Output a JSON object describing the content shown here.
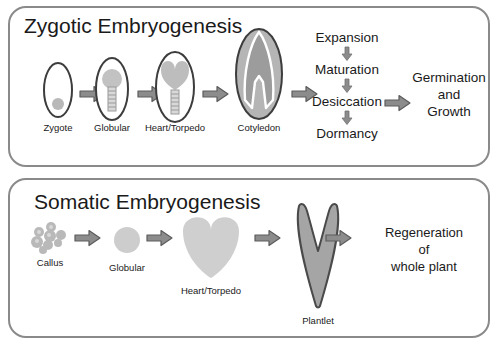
{
  "diagram": {
    "title_semantic": "zygotic-vs-somatic-embryogenesis",
    "colors": {
      "panel_border": "#8a8a8a",
      "arrow_fill": "#8c8c8c",
      "arrow_stroke": "#5c5c5c",
      "embryo_light_gray": "#c9c9c9",
      "embryo_mid_gray": "#a8a8a8",
      "outline_dark": "#3d3d3d",
      "text": "#1a1a1a",
      "background": "#ffffff"
    }
  },
  "panels": [
    {
      "id": "zygotic",
      "title": "Zygotic Embryogenesis",
      "stages": [
        {
          "label": "Zygote",
          "icon": "zygote-embryo-icon"
        },
        {
          "label": "Globular",
          "icon": "globular-embryo-icon"
        },
        {
          "label": "Heart/Torpedo",
          "icon": "heart-torpedo-embryo-icon"
        },
        {
          "label": "Cotyledon",
          "icon": "cotyledon-embryo-icon"
        }
      ],
      "chain": [
        {
          "label": "Expansion"
        },
        {
          "label": "Maturation"
        },
        {
          "label": "Desiccation"
        },
        {
          "label": "Dormancy"
        }
      ],
      "outcome_lines": [
        "Germination",
        "and",
        "Growth"
      ]
    },
    {
      "id": "somatic",
      "title": "Somatic Embryogenesis",
      "stages": [
        {
          "label": "Callus",
          "icon": "callus-cluster-icon"
        },
        {
          "label": "Globular",
          "icon": "globular-embryo-icon"
        },
        {
          "label": "Heart/Torpedo",
          "icon": "heart-torpedo-embryo-icon"
        },
        {
          "label": "Plantlet",
          "icon": "plantlet-icon"
        }
      ],
      "outcome_lines": [
        "Regeneration",
        "of",
        "whole plant"
      ]
    }
  ]
}
